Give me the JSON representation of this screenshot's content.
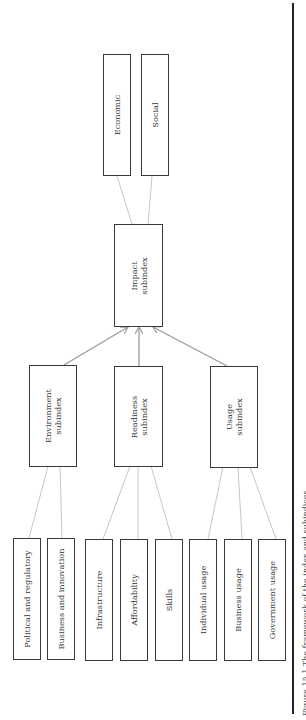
{
  "diagram": {
    "orientation": "rotated-90-counterclockwise",
    "top": {
      "label": "Impact subindex",
      "children": [
        "Economic",
        "Social"
      ]
    },
    "subindices": [
      {
        "label": "Environment subindex",
        "components": [
          "Political and regulatory",
          "Business and innovation"
        ]
      },
      {
        "label": "Readiness subindex",
        "components": [
          "Infrastructure",
          "Affordability",
          "Skills"
        ]
      },
      {
        "label": "Usage subindex",
        "components": [
          "Individual usage",
          "Business usage",
          "Government usage"
        ]
      }
    ],
    "edges": [
      {
        "from": "Environment subindex",
        "to": "Impact subindex",
        "type": "arrow"
      },
      {
        "from": "Readiness subindex",
        "to": "Impact subindex",
        "type": "arrow"
      },
      {
        "from": "Usage subindex",
        "to": "Impact subindex",
        "type": "arrow"
      },
      {
        "from": "Impact subindex",
        "to": "Economic",
        "type": "line"
      },
      {
        "from": "Impact subindex",
        "to": "Social",
        "type": "line"
      },
      {
        "from": "Political and regulatory",
        "to": "Environment subindex",
        "type": "line"
      },
      {
        "from": "Business and innovation",
        "to": "Environment subindex",
        "type": "line"
      },
      {
        "from": "Infrastructure",
        "to": "Readiness subindex",
        "type": "line"
      },
      {
        "from": "Affordability",
        "to": "Readiness subindex",
        "type": "line"
      },
      {
        "from": "Skills",
        "to": "Readiness subindex",
        "type": "line"
      },
      {
        "from": "Individual usage",
        "to": "Usage subindex",
        "type": "line"
      },
      {
        "from": "Business usage",
        "to": "Usage subindex",
        "type": "line"
      },
      {
        "from": "Government usage",
        "to": "Usage subindex",
        "type": "line"
      }
    ],
    "colors": {
      "box_border": "#3a3a3a",
      "arrow": "#9a9a9a",
      "line": "#b8b8b8",
      "rule": "#222222",
      "text": "#333333"
    }
  },
  "labels": {
    "economic": "Economic",
    "social": "Social",
    "impact": "Impact\nsubindex",
    "environment": "Environment\nsubindex",
    "readiness": "Readiness\nsubindex",
    "usage": "Usage\nsubindex",
    "political": "Political and regulatory",
    "business_innovation": "Business and innovation",
    "infrastructure": "Infrastructure",
    "affordability": "Affordability",
    "skills": "Skills",
    "individual_usage": "Individual usage",
    "business_usage": "Business usage",
    "government_usage": "Government usage"
  },
  "caption": "Figure 15.1   The framework of the index and subindices"
}
